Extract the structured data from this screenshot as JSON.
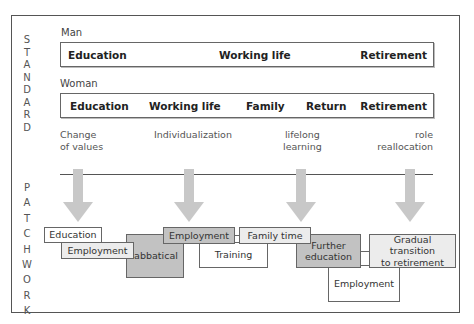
{
  "standard": {
    "side_label": [
      "S",
      "T",
      "A",
      "N",
      "D",
      "A",
      "R",
      "D"
    ],
    "man": {
      "label": "Man",
      "phases": [
        "Education",
        "Working life",
        "Retirement"
      ]
    },
    "woman": {
      "label": "Woman",
      "phases": [
        "Education",
        "Working life",
        "Family",
        "Return",
        "Retirement"
      ]
    }
  },
  "drivers": [
    {
      "line1": "Change",
      "line2": "of values"
    },
    {
      "line1": "Individualization",
      "line2": ""
    },
    {
      "line1": "lifelong",
      "line2": "learning"
    },
    {
      "line1": "role",
      "line2": "reallocation"
    }
  ],
  "patchwork": {
    "side_label": [
      "P",
      "A",
      "T",
      "C",
      "H",
      "W",
      "O",
      "R",
      "K"
    ],
    "boxes": {
      "education": "Education",
      "employment1": "Employment",
      "sabbatical": "Sabbatical",
      "employment2": "Employment",
      "training": "Training",
      "family_time": "Family time",
      "further_education_1": "Further",
      "further_education_2": "education",
      "employment3": "Employment",
      "gradual_1": "Gradual transition",
      "gradual_2": "to retirement"
    }
  },
  "colors": {
    "arrow": "#c8c8c8",
    "dark_box": "#c2c2c2",
    "light_box": "#ececec",
    "border": "#666666"
  }
}
